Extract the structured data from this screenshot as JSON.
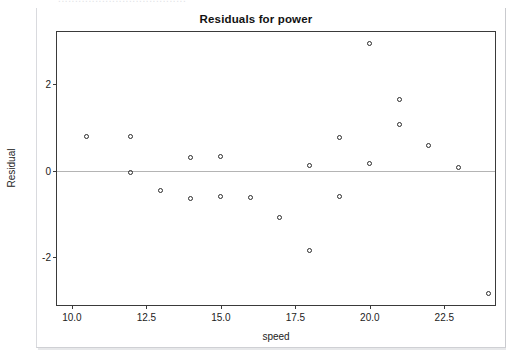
{
  "top_cut_text": "......................................",
  "chart_data": {
    "type": "scatter",
    "title": "Residuals for power",
    "xlabel": "speed",
    "ylabel": "Residual",
    "xlim": [
      9.5,
      24.2
    ],
    "ylim": [
      -3.1,
      3.2
    ],
    "grid": false,
    "legend": null,
    "zero_reference_line": 0,
    "xticks": [
      "10.0",
      "12.5",
      "15.0",
      "17.5",
      "20.0",
      "22.5"
    ],
    "xtick_values": [
      10.0,
      12.5,
      15.0,
      17.5,
      20.0,
      22.5
    ],
    "yticks": [
      "2",
      "0",
      "-2"
    ],
    "ytick_values": [
      2,
      0,
      -2
    ],
    "marker": "open-circle",
    "marker_color": "#2b2b2b",
    "points": [
      {
        "x": 10.5,
        "y": 0.77
      },
      {
        "x": 12.0,
        "y": 0.77
      },
      {
        "x": 12.0,
        "y": -0.05
      },
      {
        "x": 13.0,
        "y": -0.47
      },
      {
        "x": 14.0,
        "y": 0.29
      },
      {
        "x": 14.0,
        "y": -0.65
      },
      {
        "x": 15.0,
        "y": 0.31
      },
      {
        "x": 15.0,
        "y": -0.61
      },
      {
        "x": 16.0,
        "y": -0.63
      },
      {
        "x": 17.0,
        "y": -1.1
      },
      {
        "x": 18.0,
        "y": 0.11
      },
      {
        "x": 18.0,
        "y": -1.86
      },
      {
        "x": 19.0,
        "y": 0.74
      },
      {
        "x": 19.0,
        "y": -0.6
      },
      {
        "x": 20.0,
        "y": 2.92
      },
      {
        "x": 20.0,
        "y": 0.14
      },
      {
        "x": 21.0,
        "y": 1.62
      },
      {
        "x": 21.0,
        "y": 1.04
      },
      {
        "x": 22.0,
        "y": 0.57
      },
      {
        "x": 23.0,
        "y": 0.06
      },
      {
        "x": 24.0,
        "y": -2.86
      }
    ]
  }
}
